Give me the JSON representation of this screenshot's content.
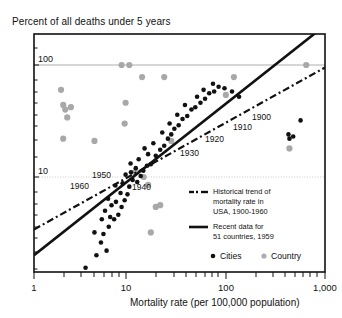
{
  "chart_data": {
    "type": "scatter",
    "title": "Percent of all deaths under 5 years",
    "xlabel": "Mortality rate (per 100,000 population)",
    "ylabel": "Percent of all deaths under 5 years",
    "xscale": "log",
    "yscale": "log",
    "xlim": [
      1,
      1000
    ],
    "ylim": [
      1,
      300
    ],
    "xticklabels": [
      "1",
      "10",
      "100",
      "1,000"
    ],
    "xtickvalues": [
      1,
      10,
      100,
      1000
    ],
    "yticklabels": [
      "100",
      "10"
    ],
    "ytickvalues": [
      100,
      10
    ],
    "grid": "horizontal-gridlines-at-10-and-100",
    "legend_position": "inside-lower-right",
    "series": [
      {
        "name": "Cities",
        "marker": "filled-circle-black",
        "color": "#111111",
        "points": [
          [
            3.4,
            1.55
          ],
          [
            6.6,
            1.25
          ],
          [
            4.4,
            2.0
          ],
          [
            5.6,
            2.2
          ],
          [
            4.9,
            2.6
          ],
          [
            4.2,
            3.2
          ],
          [
            5.2,
            3.1
          ],
          [
            5.9,
            3.6
          ],
          [
            5.0,
            4.2
          ],
          [
            6.1,
            4.4
          ],
          [
            6.7,
            4.2
          ],
          [
            5.4,
            5.0
          ],
          [
            7.4,
            4.6
          ],
          [
            6.3,
            5.6
          ],
          [
            7.0,
            6.0
          ],
          [
            5.8,
            6.4
          ],
          [
            8.0,
            5.4
          ],
          [
            8.6,
            6.2
          ],
          [
            7.8,
            7.2
          ],
          [
            9.2,
            7.0
          ],
          [
            6.9,
            8.4
          ],
          [
            8.2,
            8.8
          ],
          [
            9.6,
            8.2
          ],
          [
            10.4,
            9.4
          ],
          [
            11.6,
            9.0
          ],
          [
            8.8,
            10.5
          ],
          [
            10.0,
            11.0
          ],
          [
            12.6,
            10.2
          ],
          [
            11.2,
            12.0
          ],
          [
            13.4,
            11.4
          ],
          [
            9.9,
            13.2
          ],
          [
            14.6,
            12.6
          ],
          [
            12.0,
            14.4
          ],
          [
            16.0,
            13.0
          ],
          [
            15.0,
            16.0
          ],
          [
            13.8,
            18.0
          ],
          [
            18.0,
            15.5
          ],
          [
            20.0,
            17.5
          ],
          [
            17.0,
            20.0
          ],
          [
            22.0,
            19.0
          ],
          [
            24.0,
            22.0
          ],
          [
            21.0,
            25.0
          ],
          [
            26.0,
            24.0
          ],
          [
            28.0,
            27.0
          ],
          [
            25.0,
            30.0
          ],
          [
            31.0,
            29.0
          ],
          [
            34.0,
            33.0
          ],
          [
            30.0,
            36.0
          ],
          [
            38.0,
            35.0
          ],
          [
            42.0,
            40.0
          ],
          [
            36.0,
            44.0
          ],
          [
            46.0,
            42.0
          ],
          [
            52.0,
            46.0
          ],
          [
            48.0,
            52.0
          ],
          [
            58.0,
            50.0
          ],
          [
            64.0,
            56.0
          ],
          [
            56.0,
            60.0
          ],
          [
            72.0,
            58.0
          ],
          [
            80.0,
            64.0
          ],
          [
            70.0,
            68.0
          ],
          [
            92.0,
            62.0
          ],
          [
            110.0,
            58.0
          ],
          [
            130.0,
            52.0
          ],
          [
            420.0,
            24.0
          ],
          [
            430.0,
            22.0
          ],
          [
            470.0,
            23.0
          ],
          [
            560.0,
            32.0
          ]
        ]
      },
      {
        "name": "Country",
        "marker": "filled-circle-gray",
        "color": "#a8a8a8",
        "points": [
          [
            1.9,
            60.0
          ],
          [
            2.0,
            44.0
          ],
          [
            2.1,
            40.0
          ],
          [
            2.4,
            42.0
          ],
          [
            2.2,
            34.0
          ],
          [
            2.0,
            22.0
          ],
          [
            4.2,
            21.0
          ],
          [
            8.6,
            30.0
          ],
          [
            8.8,
            46.0
          ],
          [
            8.0,
            100.0
          ],
          [
            9.6,
            100.0
          ],
          [
            13.0,
            78.0
          ],
          [
            22.0,
            78.0
          ],
          [
            10.0,
            220.0
          ],
          [
            26.0,
            21.0
          ],
          [
            11.0,
            11.0
          ],
          [
            13.5,
            10.0
          ],
          [
            15.0,
            8.5
          ],
          [
            18.0,
            5.4
          ],
          [
            20.0,
            5.6
          ],
          [
            16.0,
            3.2
          ],
          [
            115.0,
            78.0
          ],
          [
            95.0,
            54.0
          ],
          [
            430.0,
            18.0
          ],
          [
            640.0,
            100.0
          ]
        ]
      }
    ],
    "trend_lines": [
      {
        "name": "Historical trend of mortality rate in USA, 1900-1960",
        "style": "dash-dot",
        "color": "#111111",
        "from": [
          1.0,
          3.4
        ],
        "to": [
          1000.0,
          95.0
        ]
      },
      {
        "name": "Recent data for 51 countries, 1959",
        "style": "solid",
        "color": "#111111",
        "from": [
          1.0,
          2.0
        ],
        "to": [
          900.0,
          210.0
        ]
      }
    ],
    "annotations": [
      {
        "text": "1900",
        "x": 252,
        "y": 120
      },
      {
        "text": "1910",
        "x": 233,
        "y": 130
      },
      {
        "text": "1920",
        "x": 205,
        "y": 142
      },
      {
        "text": "1930",
        "x": 180,
        "y": 156
      },
      {
        "text": "1940",
        "x": 132,
        "y": 190
      },
      {
        "text": "1950",
        "x": 92,
        "y": 178
      },
      {
        "text": "1960",
        "x": 70,
        "y": 189
      }
    ]
  },
  "legend": {
    "entries": [
      {
        "marker": "dash-dot-line",
        "lines": [
          "Historical trend of",
          "mortality rate in",
          "USA, 1900-1960"
        ]
      },
      {
        "marker": "solid-line",
        "lines": [
          "Recent data for",
          "51 countries, 1959"
        ]
      }
    ],
    "markers": [
      {
        "label": "Cities",
        "marker": "black-dot"
      },
      {
        "label": "Country",
        "marker": "gray-dot"
      }
    ]
  }
}
